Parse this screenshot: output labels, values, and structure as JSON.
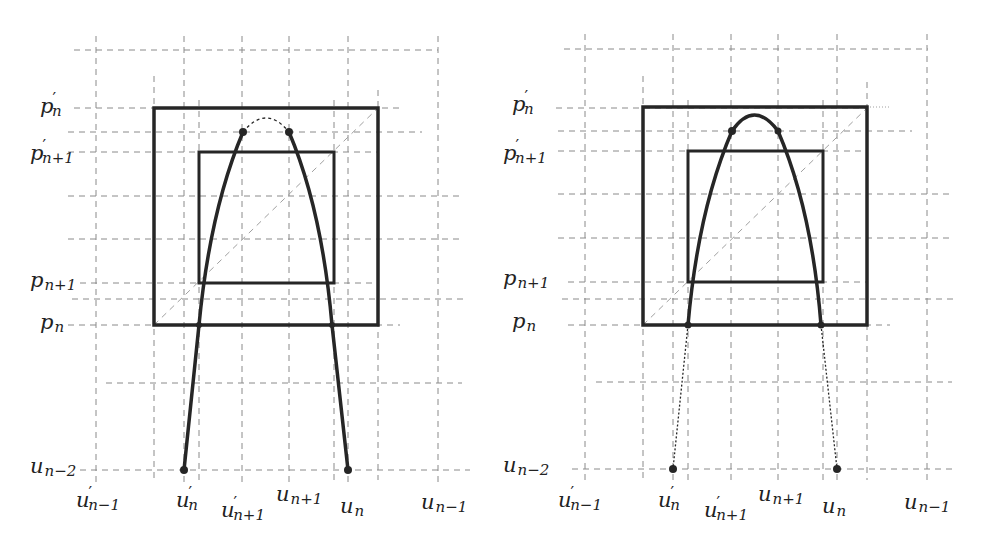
{
  "figure": {
    "panels": [
      {
        "id": "left",
        "top_arc_style": "dashed",
        "bottom_legs_style": "solid"
      },
      {
        "id": "right",
        "top_arc_style": "solid",
        "bottom_legs_style": "dotted"
      }
    ],
    "y_labels": {
      "p_prime_n": {
        "base": "p",
        "prime": "′",
        "sub": "n"
      },
      "p_prime_n1": {
        "base": "p",
        "prime": "′",
        "sub": "n+1"
      },
      "p_n1": {
        "base": "p",
        "sub": "n+1"
      },
      "p_n": {
        "base": "p",
        "sub": "n"
      },
      "u_n2": {
        "base": "u",
        "sub": "n−2"
      }
    },
    "x_labels": {
      "u_prime_nm1": {
        "base": "u",
        "prime": "′",
        "sub": "n−1"
      },
      "u_prime_n": {
        "base": "u",
        "prime": "′",
        "sub": "n"
      },
      "u_prime_n1": {
        "base": "u",
        "prime": "′",
        "sub": "n+1"
      },
      "u_n1": {
        "base": "u",
        "sub": "n+1"
      },
      "u_n": {
        "base": "u",
        "sub": "n"
      },
      "u_nm1": {
        "base": "u",
        "sub": "n−1"
      }
    },
    "colors": {
      "stroke": "#262626",
      "grid": "#8a8a8a",
      "diagonal": "#a0a0a0",
      "text": "#222222"
    }
  }
}
